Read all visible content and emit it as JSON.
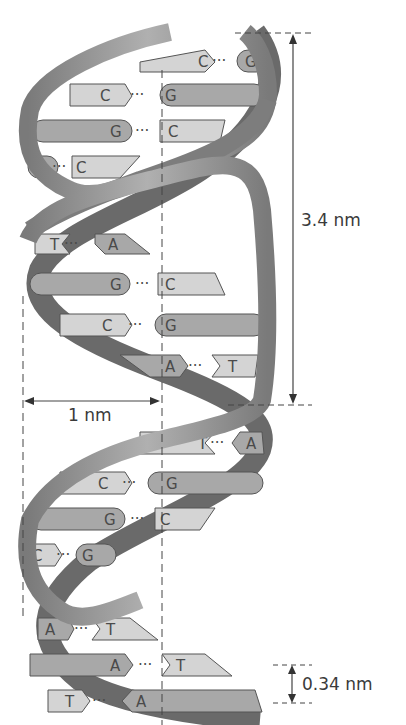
{
  "figure": {
    "measurements": {
      "pitch": "3.4 nm",
      "radius": "1 nm",
      "base_spacing": "0.34 nm"
    },
    "base_pairs": [
      {
        "left": "C",
        "right": "G"
      },
      {
        "left": "C",
        "right": "G"
      },
      {
        "left": "G",
        "right": "C"
      },
      {
        "left": "G",
        "right": "C"
      },
      {
        "left": "T",
        "right": "A"
      },
      {
        "left": "G",
        "right": "C"
      },
      {
        "left": "C",
        "right": "G"
      },
      {
        "left": "A",
        "right": "T"
      },
      {
        "left": "T",
        "right": "A"
      },
      {
        "left": "C",
        "right": "G"
      },
      {
        "left": "G",
        "right": "C"
      },
      {
        "left": "C",
        "right": "G"
      },
      {
        "left": "A",
        "right": "T"
      },
      {
        "left": "A",
        "right": "T"
      },
      {
        "left": "T",
        "right": "A"
      }
    ],
    "colors": {
      "strand_dark": "#6e6e6e",
      "strand_light": "#9a9a9a",
      "base_light": "#d4d4d4",
      "base_mid": "#a8a8a8",
      "line": "#444444"
    }
  }
}
